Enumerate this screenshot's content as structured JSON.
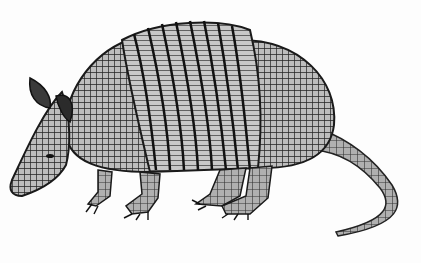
{
  "image": {
    "subject": "armadillo",
    "style": "grayscale illustration",
    "background_color": "#ffffff",
    "ink_color": "#1a1a1a",
    "shell_band_count": 9
  }
}
